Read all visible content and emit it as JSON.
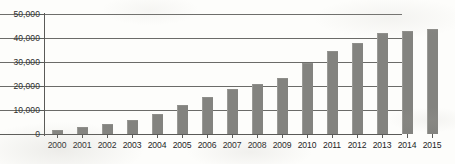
{
  "chart_data": {
    "type": "bar",
    "title": "",
    "subtitle": "",
    "xlabel": "",
    "ylabel": "",
    "categories": [
      "2000",
      "2001",
      "2002",
      "2003",
      "2004",
      "2005",
      "2006",
      "2007",
      "2008",
      "2009",
      "2010",
      "2011",
      "2012",
      "2013",
      "2014",
      "2015"
    ],
    "values": [
      1800,
      2900,
      4000,
      6000,
      8300,
      12200,
      15400,
      18700,
      21000,
      23300,
      29800,
      34700,
      37800,
      42300,
      43000,
      43800
    ],
    "series": [
      {
        "name": "",
        "values": [
          1800,
          2900,
          4000,
          6000,
          8300,
          12200,
          15400,
          18700,
          21000,
          23300,
          29800,
          34700,
          37800,
          42300,
          43000,
          43800
        ]
      }
    ],
    "ylim": [
      0,
      50000
    ],
    "y_ticks": [
      0,
      10000,
      20000,
      30000,
      40000,
      50000
    ],
    "y_tick_labels": [
      "0",
      "10,000",
      "20,000",
      "30,000",
      "40,000",
      "50,000"
    ],
    "x_tick_labels": [
      "2000",
      "2001",
      "2002",
      "2003",
      "2004",
      "2005",
      "2006",
      "2007",
      "2008",
      "2009",
      "2010",
      "2011",
      "2012",
      "2013",
      "2014",
      "2015"
    ],
    "grid": true,
    "grid_axis": "y",
    "legend": false,
    "legend_position": "none",
    "annotations": [],
    "colors": {
      "bar": "#83837f",
      "gridline": "#6b6b68",
      "axis": "#5a5a57",
      "text": "#24241f",
      "background": "#fdfdfb"
    }
  }
}
